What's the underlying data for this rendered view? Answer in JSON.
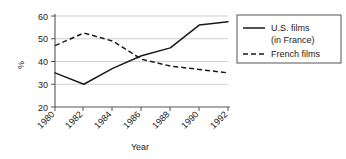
{
  "chart_data": {
    "type": "line",
    "title": "",
    "xlabel": "Year",
    "ylabel": "%",
    "x": [
      1980,
      1982,
      1984,
      1986,
      1988,
      1990,
      1992
    ],
    "xticklabels": [
      "1980",
      "1982",
      "1984",
      "1986",
      "1988",
      "1990",
      "1992"
    ],
    "yticklabels": [
      "20",
      "30",
      "40",
      "50",
      "60"
    ],
    "yticks": [
      20,
      30,
      40,
      50,
      60
    ],
    "ylim": [
      20,
      60
    ],
    "xlim": [
      1980,
      1992
    ],
    "grid": "horizontal",
    "legend_position": "right-outside",
    "series": [
      {
        "name": "U.S. films (in France)",
        "style": "solid",
        "color": "#1a1a1a",
        "values": [
          35,
          30,
          37,
          42.5,
          46,
          56,
          57.5
        ]
      },
      {
        "name": "French films",
        "style": "dashed",
        "color": "#1a1a1a",
        "values": [
          47,
          52.5,
          49,
          41,
          38,
          36.5,
          35
        ]
      }
    ]
  },
  "axes": {
    "ylabel": "%",
    "xlabel": "Year",
    "ytick_0": "20",
    "ytick_1": "30",
    "ytick_2": "40",
    "ytick_3": "50",
    "ytick_4": "60",
    "xtick_0": "1980",
    "xtick_1": "1982",
    "xtick_2": "1984",
    "xtick_3": "1986",
    "xtick_4": "1988",
    "xtick_5": "1990",
    "xtick_6": "1992"
  },
  "legend": {
    "entry_1_line_1": "U.S. films",
    "entry_1_line_2": "(in France)",
    "entry_2_line_1": "French films"
  }
}
